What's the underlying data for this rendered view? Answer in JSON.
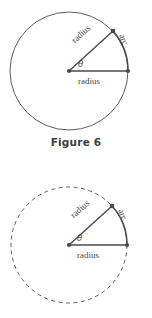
{
  "document": {
    "title": "Figure 6 — circle sector geometry"
  },
  "caption": {
    "text": "Figure 6"
  },
  "colors": {
    "stroke": "#4a4a4a",
    "text": "#454545",
    "caption": "#3c3c3c",
    "background": "#ffffff"
  },
  "figures": [
    {
      "id": "figure-top",
      "circle_style": "solid",
      "labels": {
        "radius_horizontal": "radius",
        "radius_diagonal": "radius",
        "arc": "arc",
        "angle": "θ"
      },
      "geometry": {
        "center_x": 69,
        "center_y": 71,
        "radius": 59,
        "sector_start_angle_deg": 0,
        "sector_end_angle_deg": 42,
        "vertex_right_x": 128,
        "vertex_right_y": 71,
        "vertex_upper_x": 113,
        "vertex_upper_y": 31
      }
    },
    {
      "id": "figure-bottom",
      "circle_style": "dashed",
      "labels": {
        "radius_horizontal": "radius",
        "radius_diagonal": "radius",
        "arc": "arc",
        "angle": "θ"
      },
      "geometry": {
        "center_x": 69,
        "center_y": 70,
        "radius": 58,
        "sector_start_angle_deg": 0,
        "sector_end_angle_deg": 42,
        "vertex_right_x": 127,
        "vertex_right_y": 70,
        "vertex_upper_x": 112,
        "vertex_upper_y": 31
      }
    }
  ]
}
